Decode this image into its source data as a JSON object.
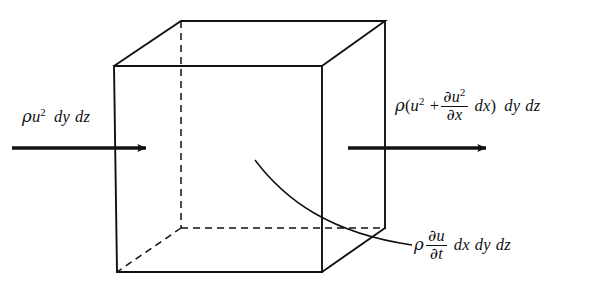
{
  "figure": {
    "background_color": "#ffffff",
    "line_color": "#111111",
    "width": 591,
    "height": 295
  },
  "labels": {
    "inflow": {
      "rho": "ρ",
      "u": "u",
      "u_exponent": "2",
      "dy": "dy",
      "dz": "dz",
      "plain_text": "ρu² dy dz"
    },
    "outflow": {
      "rho": "ρ",
      "open_paren": "(",
      "u": "u",
      "u_exponent": "2",
      "plus": "+",
      "numerator_partial": "∂",
      "numerator_u": "u",
      "numerator_exponent": "2",
      "denominator_partial": "∂",
      "denominator_x": "x",
      "dx": "dx",
      "close_paren": ")",
      "dy": "dy",
      "dz": "dz",
      "plain_text": "ρ(u² + ∂u²/∂x dx) dy dz"
    },
    "unsteady": {
      "rho": "ρ",
      "numerator_partial": "∂",
      "numerator_u": "u",
      "denominator_partial": "∂",
      "denominator_t": "t",
      "dx": "dx",
      "dy": "dy",
      "dz": "dz",
      "plain_text": "ρ ∂u/∂t dx dy dz"
    }
  },
  "geometry": {
    "cube": {
      "front_face": {
        "top_left": [
          114,
          66
        ],
        "top_right": [
          322,
          66
        ],
        "bottom_right": [
          322,
          272
        ],
        "bottom_left": [
          117,
          272
        ]
      },
      "back_face": {
        "top_left": [
          181,
          21
        ],
        "top_right": [
          385,
          21
        ],
        "bottom_right": [
          385,
          228
        ],
        "bottom_left": [
          181,
          228
        ]
      },
      "hidden_edges": [
        "back-left-vertical",
        "back-bottom-left-to-front-bottom-left",
        "back-bottom-left-to-back-bottom-right"
      ]
    },
    "arrow_in": {
      "from": [
        12,
        148
      ],
      "to": [
        150,
        148
      ]
    },
    "arrow_out": {
      "from": [
        348,
        148
      ],
      "to": [
        490,
        148
      ]
    },
    "leader_curve": {
      "from": [
        255,
        160
      ],
      "to": [
        412,
        245
      ]
    }
  }
}
